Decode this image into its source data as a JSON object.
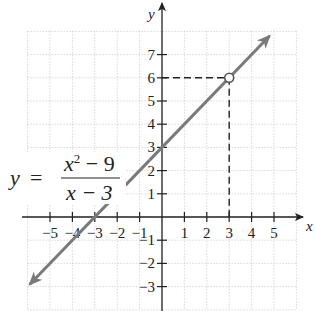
{
  "chart_data": {
    "type": "line",
    "title": "",
    "xlabel": "x",
    "ylabel": "y",
    "xlim": [
      -6,
      6
    ],
    "ylim": [
      -4,
      8
    ],
    "grid": true,
    "x_ticks": [
      -5,
      -4,
      -3,
      -2,
      -1,
      1,
      2,
      3,
      4,
      5
    ],
    "y_ticks": [
      -3,
      -2,
      -1,
      1,
      2,
      3,
      4,
      5,
      6,
      7
    ],
    "x_tick_labels": [
      "−5",
      "−4",
      "−3",
      "−2",
      "−1",
      "1",
      "2",
      "3",
      "4",
      "5"
    ],
    "y_tick_labels": [
      "−3",
      "−2",
      "−1",
      "1",
      "2",
      "3",
      "4",
      "5",
      "6",
      "7"
    ],
    "series": [
      {
        "name": "y = (x^2 - 9)/(x - 3)",
        "equivalent": "y = x + 3, x ≠ 3",
        "x": [
          -5.9,
          4.8
        ],
        "y": [
          -2.9,
          7.8
        ],
        "color": "#7a7a7a",
        "arrows": "both"
      }
    ],
    "hole": {
      "x": 3,
      "y": 6,
      "style": "open-circle"
    },
    "guides": [
      {
        "from": [
          0,
          6
        ],
        "to": [
          3,
          6
        ],
        "style": "dashed"
      },
      {
        "from": [
          3,
          6
        ],
        "to": [
          3,
          0
        ],
        "style": "dashed"
      }
    ],
    "annotations": [
      {
        "text": "y = (x² − 9)/(x − 3)",
        "location": "left-middle"
      }
    ]
  },
  "equation": {
    "lhs": "y",
    "equals": "=",
    "numerator_base": "x",
    "numerator_exp": "2",
    "numerator_rest": " − 9",
    "denominator": "x − 3"
  }
}
